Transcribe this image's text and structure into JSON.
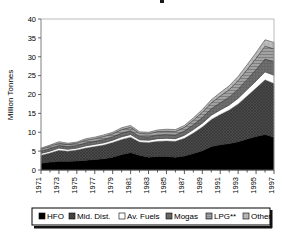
{
  "chart_data": {
    "type": "area",
    "stacked": true,
    "title": "",
    "xlabel": "",
    "ylabel": "Million Tonnes",
    "ylim": [
      0,
      40
    ],
    "yticks": [
      0,
      5,
      10,
      15,
      20,
      25,
      30,
      35,
      40
    ],
    "grid": false,
    "legend_position": "bottom",
    "x": [
      1971,
      1972,
      1973,
      1974,
      1975,
      1976,
      1977,
      1978,
      1979,
      1980,
      1981,
      1982,
      1983,
      1984,
      1985,
      1986,
      1987,
      1988,
      1989,
      1990,
      1991,
      1992,
      1993,
      1994,
      1995,
      1996,
      1997
    ],
    "xtick_labels": [
      "1971",
      "1973",
      "1975",
      "1977",
      "1979",
      "1981",
      "1983",
      "1985",
      "1987",
      "1989",
      "1991",
      "1993",
      "1995",
      "1997"
    ],
    "series": [
      {
        "name": "HFO",
        "color": "#000000",
        "pattern": "solid",
        "values": [
          1.8,
          2.1,
          2.3,
          2.3,
          2.4,
          2.6,
          2.8,
          3.0,
          3.4,
          4.1,
          4.6,
          3.9,
          3.4,
          3.6,
          3.6,
          3.4,
          3.7,
          4.4,
          5.1,
          6.2,
          6.7,
          7.0,
          7.5,
          8.2,
          8.9,
          9.4,
          8.7
        ]
      },
      {
        "name": "Mid. Dist.",
        "color": "#4d4d4d",
        "pattern": "crosshatch",
        "values": [
          2.1,
          2.4,
          2.9,
          2.7,
          2.9,
          3.2,
          3.4,
          3.6,
          3.9,
          4.0,
          4.1,
          3.5,
          3.9,
          4.0,
          4.1,
          4.2,
          4.7,
          5.4,
          6.3,
          7.2,
          8.0,
          8.9,
          10.0,
          11.4,
          12.8,
          14.5,
          14.2
        ]
      },
      {
        "name": "Av. Fuels",
        "color": "#ffffff",
        "pattern": "solid",
        "values": [
          0.5,
          0.5,
          0.6,
          0.5,
          0.5,
          0.6,
          0.6,
          0.6,
          0.6,
          0.7,
          0.7,
          0.6,
          0.6,
          0.7,
          0.7,
          0.7,
          0.8,
          0.9,
          1.0,
          1.1,
          1.2,
          1.3,
          1.5,
          1.7,
          1.9,
          2.1,
          2.2
        ]
      },
      {
        "name": "Mogas",
        "color": "#6e6e6e",
        "pattern": "dense-grid",
        "values": [
          0.6,
          0.7,
          0.7,
          0.7,
          0.7,
          0.8,
          0.8,
          0.9,
          0.9,
          1.0,
          1.0,
          0.9,
          0.9,
          1.0,
          1.0,
          1.0,
          1.1,
          1.3,
          1.5,
          1.7,
          1.9,
          2.1,
          2.4,
          2.7,
          3.0,
          3.4,
          3.5
        ]
      },
      {
        "name": "LPG**",
        "color": "#9a9a9a",
        "pattern": "hlines",
        "values": [
          0.5,
          0.6,
          0.6,
          0.6,
          0.6,
          0.7,
          0.7,
          0.8,
          0.8,
          0.9,
          0.9,
          0.8,
          0.8,
          0.9,
          0.9,
          0.9,
          1.0,
          1.2,
          1.4,
          1.6,
          1.8,
          2.0,
          2.3,
          2.6,
          3.0,
          3.4,
          3.5
        ]
      },
      {
        "name": "Other",
        "color": "#b5b5b5",
        "pattern": "light-grid",
        "values": [
          0.3,
          0.3,
          0.4,
          0.3,
          0.3,
          0.4,
          0.4,
          0.4,
          0.4,
          0.5,
          0.5,
          0.4,
          0.4,
          0.4,
          0.5,
          0.5,
          0.5,
          0.6,
          0.7,
          0.8,
          0.9,
          1.0,
          1.1,
          1.3,
          1.5,
          1.7,
          1.7
        ]
      }
    ],
    "totals": [
      5.8,
      6.6,
      7.5,
      7.1,
      7.4,
      8.3,
      8.7,
      9.3,
      10.0,
      11.2,
      11.8,
      10.1,
      10.0,
      10.6,
      10.8,
      10.7,
      11.8,
      13.8,
      16.0,
      18.6,
      20.5,
      22.3,
      24.8,
      27.9,
      31.1,
      34.5,
      33.8
    ]
  },
  "legend": {
    "items": [
      {
        "label": "HFO",
        "swatch": "black-swatch"
      },
      {
        "label": "Mid. Dist.",
        "swatch": "dark-gray-swatch"
      },
      {
        "label": "Av. Fuels",
        "swatch": "white-swatch"
      },
      {
        "label": "Mogas",
        "swatch": "gray-swatch"
      },
      {
        "label": "LPG**",
        "swatch": "light-gray-swatch"
      },
      {
        "label": "Other",
        "swatch": "lighter-gray-swatch"
      }
    ]
  }
}
